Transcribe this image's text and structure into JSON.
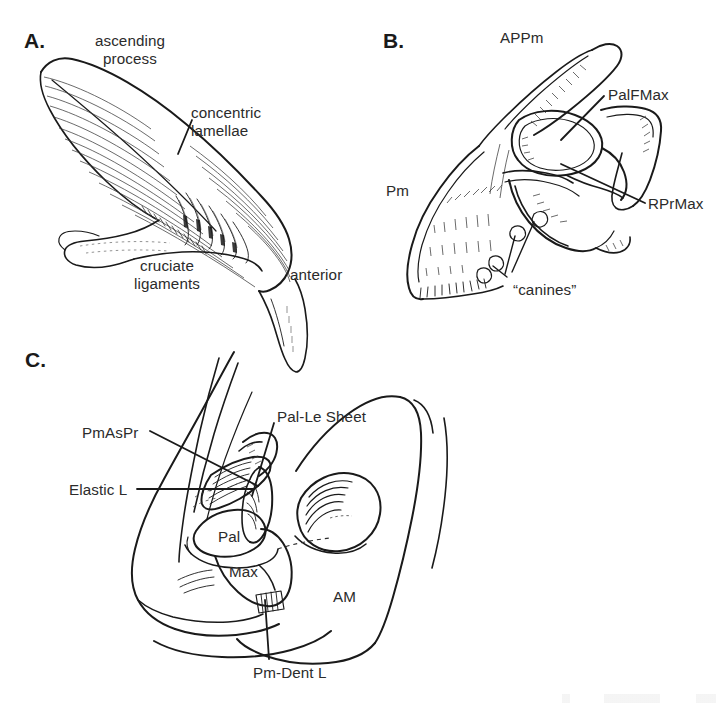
{
  "figure": {
    "type": "anatomical-line-drawing",
    "panel_count": 3,
    "background": "#ffffff",
    "ink_color": "#1a1a1a",
    "label_color": "#2b2b2b"
  },
  "panels": [
    {
      "id": "A",
      "letter": "A.",
      "subject": "ascending process with concentric lamellae and cruciate ligaments",
      "labels": [
        {
          "name": "ascending-process",
          "text": "ascending\nprocess",
          "x": 130,
          "y": 32,
          "align": "center"
        },
        {
          "name": "concentric-lamellae",
          "text": "concentric\nlamellae",
          "x": 191,
          "y": 104,
          "align": "left"
        },
        {
          "name": "cruciate-ligaments",
          "text": "cruciate\nligaments",
          "x": 167,
          "y": 257,
          "align": "center"
        },
        {
          "name": "anterior",
          "text": "anterior",
          "x": 290,
          "y": 266,
          "align": "left"
        }
      ]
    },
    {
      "id": "B",
      "letter": "B.",
      "subject": "premaxilla and maxilla in lateral view",
      "labels": [
        {
          "name": "appm",
          "text": "APPm",
          "x": 500,
          "y": 29,
          "align": "left"
        },
        {
          "name": "palfmax",
          "text": "PalFMax",
          "x": 608,
          "y": 86,
          "align": "left"
        },
        {
          "name": "pm",
          "text": "Pm",
          "x": 386,
          "y": 182,
          "align": "left"
        },
        {
          "name": "rprmax",
          "text": "RPrMax",
          "x": 648,
          "y": 195,
          "align": "left"
        },
        {
          "name": "canines",
          "text": "“canines”",
          "x": 513,
          "y": 281,
          "align": "left"
        }
      ]
    },
    {
      "id": "C",
      "letter": "C.",
      "subject": "palatine, maxilla and adductor mandibulae with ligaments",
      "labels": [
        {
          "name": "pmaspr",
          "text": "PmAsPr",
          "x": 82,
          "y": 424,
          "align": "left"
        },
        {
          "name": "pal-le-sheet",
          "text": "Pal-Le Sheet",
          "x": 277,
          "y": 408,
          "align": "left"
        },
        {
          "name": "elastic-l",
          "text": "Elastic L",
          "x": 69,
          "y": 481,
          "align": "left"
        },
        {
          "name": "pal",
          "text": "Pal",
          "x": 218,
          "y": 528,
          "align": "left"
        },
        {
          "name": "max",
          "text": "Max",
          "x": 229,
          "y": 563,
          "align": "left"
        },
        {
          "name": "am",
          "text": "AM",
          "x": 333,
          "y": 588,
          "align": "left"
        },
        {
          "name": "pm-dent-l",
          "text": "Pm-Dent L",
          "x": 253,
          "y": 664,
          "align": "left"
        }
      ]
    }
  ]
}
